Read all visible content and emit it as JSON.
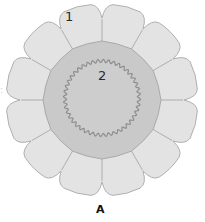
{
  "figure": {
    "caption": "A",
    "labels": {
      "outer_cells": "1",
      "inner_region": "2"
    },
    "edge_mark": ":"
  },
  "geometry": {
    "center_x": 102,
    "center_y": 100,
    "outer_cell_count": 12,
    "outer_radius": 96,
    "notch_radius": 82,
    "inner_region_radius": 58,
    "wavy_ring_radius": 37,
    "wavy_ring_teeth": 44
  },
  "colors": {
    "outer_cell_fill": "#e3e3e3",
    "outer_cell_stroke": "#a8a8a8",
    "inner_region_fill": "#c9c9c9",
    "inner_region_stroke": "#a5a5a5",
    "wavy_ring_stroke": "#8e8e8e",
    "ring_interior_fill": "#cdcdcd"
  }
}
